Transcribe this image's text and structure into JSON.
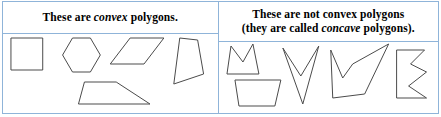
{
  "figure": {
    "border_color": "#8fb4d9",
    "stroke_color": "#4a4a4a",
    "background": "#ffffff"
  },
  "left_cell": {
    "header": {
      "text_before": "These are ",
      "emphasis": "convex",
      "text_after": " polygons."
    },
    "shapes": [
      {
        "name": "square",
        "label": "square",
        "points": "8,4 40,4 40,36 8,36"
      },
      {
        "name": "hexagon",
        "label": "hexagon",
        "points": "70,4 88,4 98,21 88,38 70,38 60,21"
      },
      {
        "name": "parallelogram",
        "label": "parallelogram",
        "points": "128,4 162,4 142,30 108,30"
      },
      {
        "name": "quadrilateral",
        "label": "quadrilateral",
        "points": "178,4 196,6 202,40 172,50"
      },
      {
        "name": "trapezoid",
        "label": "trapezoid",
        "points": "82,48 114,48 148,70 76,70"
      }
    ]
  },
  "right_cell": {
    "header": {
      "line1": "These are not convex polygons",
      "line2_before": "(they are called ",
      "line2_emphasis": "concave",
      "line2_after": " polygons)."
    },
    "shapes": [
      {
        "name": "crown-m",
        "label": "crown",
        "points": "8,32 12,4 24,20 34,2 40,32"
      },
      {
        "name": "bowl",
        "label": "bowl",
        "points": "16,38 62,38 56,64 20,64"
      },
      {
        "name": "dart",
        "label": "dart",
        "points": "64,6 82,34 100,4 84,62"
      },
      {
        "name": "checkmark",
        "label": "checkmark",
        "points": "112,8 124,36 134,22 170,2 146,52 114,56"
      },
      {
        "name": "zigzag-e",
        "label": "zigzag block",
        "points": "178,8 206,8 192,22 208,30 190,44 208,56 178,56"
      }
    ]
  }
}
